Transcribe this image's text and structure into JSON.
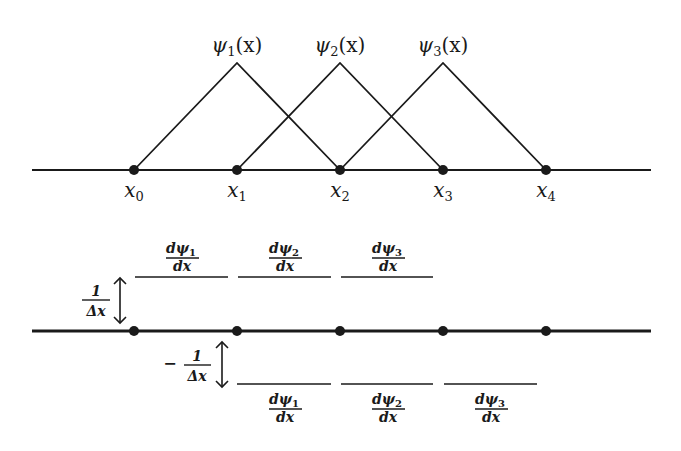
{
  "top_panel": {
    "basis_labels": [
      {
        "name": "ψ",
        "sub": "1",
        "arg": "(x)"
      },
      {
        "name": "ψ",
        "sub": "2",
        "arg": "(x)"
      },
      {
        "name": "ψ",
        "sub": "3",
        "arg": "(x)"
      }
    ],
    "node_labels": [
      {
        "name": "x",
        "sub": "0"
      },
      {
        "name": "x",
        "sub": "1"
      },
      {
        "name": "x",
        "sub": "2"
      },
      {
        "name": "x",
        "sub": "3"
      },
      {
        "name": "x",
        "sub": "4"
      }
    ]
  },
  "bottom_panel": {
    "upper_magnitude": {
      "num": "1",
      "den": "Δx"
    },
    "lower_magnitude": {
      "sign": "−",
      "num": "1",
      "den": "Δx"
    },
    "upper_derivatives": [
      {
        "num": "dψ",
        "sub": "1",
        "den": "dx"
      },
      {
        "num": "dψ",
        "sub": "2",
        "den": "dx"
      },
      {
        "num": "dψ",
        "sub": "3",
        "den": "dx"
      }
    ],
    "lower_derivatives": [
      {
        "num": "dψ",
        "sub": "1",
        "den": "dx"
      },
      {
        "num": "dψ",
        "sub": "2",
        "den": "dx"
      },
      {
        "num": "dψ",
        "sub": "3",
        "den": "dx"
      }
    ]
  },
  "colors": {
    "ink": "#1a1a1a",
    "background": "#ffffff"
  }
}
